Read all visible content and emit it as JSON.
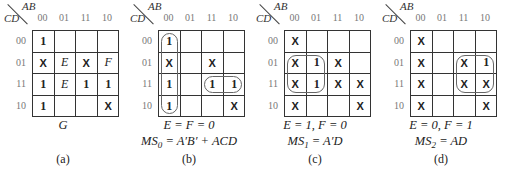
{
  "axis": {
    "col_var": "AB",
    "row_var": "CD",
    "col_labels": [
      "00",
      "01",
      "11",
      "10"
    ],
    "row_labels": [
      "00",
      "01",
      "11",
      "10"
    ]
  },
  "maps": [
    {
      "id": "a",
      "left": 0,
      "cells": [
        [
          "1",
          "",
          "",
          ""
        ],
        [
          "X",
          "E",
          "X",
          "F"
        ],
        [
          "1",
          "E",
          "1",
          "1"
        ],
        [
          "1",
          "",
          "",
          "X"
        ]
      ],
      "caption1": "G",
      "caption2": "",
      "fig": "(a)",
      "loops": []
    },
    {
      "id": "b",
      "left": 126,
      "cells": [
        [
          "1",
          "",
          "",
          ""
        ],
        [
          "X",
          "",
          "X",
          ""
        ],
        [
          "1",
          "",
          "1",
          "1"
        ],
        [
          "1",
          "",
          "",
          "X"
        ]
      ],
      "caption1": "E = F = 0",
      "caption2_prefix": "MS",
      "caption2_sub": "0",
      "caption2_rest": " = A′B′ + ACD",
      "fig": "(b)",
      "loops": [
        {
          "r": 0,
          "c": 0,
          "rs": 4,
          "cs": 1
        },
        {
          "r": 2,
          "c": 2,
          "rs": 1,
          "cs": 2
        }
      ]
    },
    {
      "id": "c",
      "left": 252,
      "cells": [
        [
          "X",
          "",
          "",
          ""
        ],
        [
          "X",
          "1",
          "X",
          ""
        ],
        [
          "X",
          "1",
          "X",
          "X"
        ],
        [
          "X",
          "",
          "",
          "X"
        ]
      ],
      "caption1": "E = 1, F = 0",
      "caption2_prefix": "MS",
      "caption2_sub": "1",
      "caption2_rest": " = A′D",
      "fig": "(c)",
      "loops": [
        {
          "r": 1,
          "c": 0,
          "rs": 2,
          "cs": 2
        }
      ]
    },
    {
      "id": "d",
      "left": 378,
      "cells": [
        [
          "X",
          "",
          "",
          ""
        ],
        [
          "X",
          "",
          "X",
          "1"
        ],
        [
          "X",
          "",
          "X",
          "X"
        ],
        [
          "X",
          "",
          "",
          "X"
        ]
      ],
      "caption1": "E = 0, F = 1",
      "caption2_prefix": "MS",
      "caption2_sub": "2",
      "caption2_rest": " = AD",
      "fig": "(d)",
      "loops": [
        {
          "r": 1,
          "c": 2,
          "rs": 2,
          "cs": 2
        }
      ]
    }
  ]
}
